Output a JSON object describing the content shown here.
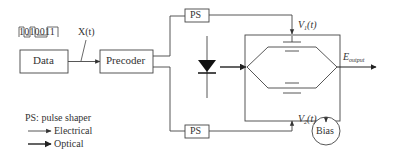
{
  "bit_pattern": {
    "bits": [
      "1",
      "0",
      "1",
      "0",
      "0",
      "1",
      "1"
    ],
    "signal_label": "X(t)"
  },
  "blocks": {
    "data": "Data",
    "precoder": "Precoder",
    "ps_top": "PS",
    "ps_bottom": "PS",
    "bias": "Bias"
  },
  "signals": {
    "v1": "V",
    "v1_sub": "1",
    "v1_suffix": "(t)",
    "v2": "V",
    "v2_sub": "2",
    "v2_suffix": "(t)",
    "output": "E",
    "output_sub": "output"
  },
  "legend": {
    "ps_note": "PS: pulse shaper",
    "electrical": "Electrical",
    "optical": "Optical"
  },
  "colors": {
    "line": "#444444",
    "text": "#333333"
  }
}
